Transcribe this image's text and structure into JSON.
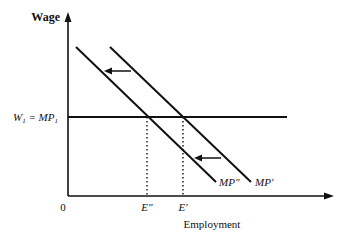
{
  "diagram": {
    "type": "labor-market-marginal-product",
    "y_axis": {
      "label": "Wage"
    },
    "x_axis": {
      "label": "Employment",
      "origin_label": "0"
    },
    "wage_line": {
      "label_left": "W",
      "label_sub1": "1",
      "label_eq": " = MP",
      "label_sub2": "1",
      "full_label": "W1 = MP1"
    },
    "curves": [
      {
        "id": "mp-double-prime",
        "label": "MP″"
      },
      {
        "id": "mp-prime",
        "label": "MP′"
      }
    ],
    "employment_points": [
      {
        "id": "e-double-prime",
        "label": "E″"
      },
      {
        "id": "e-prime",
        "label": "E′"
      }
    ],
    "shift_arrows": [
      {
        "id": "upper-shift",
        "direction": "left"
      },
      {
        "id": "lower-shift",
        "direction": "left"
      }
    ],
    "colors": {
      "line": "#111111",
      "background": "#ffffff"
    }
  }
}
